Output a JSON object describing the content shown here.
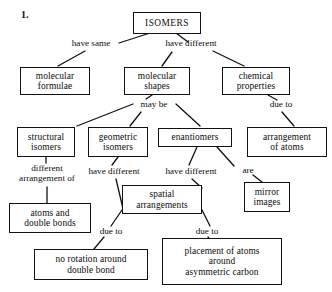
{
  "diagram": {
    "item_number": "1.",
    "title_node": "ISOMERS",
    "nodes": [
      {
        "id": "isomers",
        "label": "ISOMERS"
      },
      {
        "id": "molecular-formulae",
        "label": "molecular\nformulae"
      },
      {
        "id": "molecular-shapes",
        "label": "molecular\nshapes"
      },
      {
        "id": "chemical-properties",
        "label": "chemical\nproperties"
      },
      {
        "id": "structural-isomers",
        "label": "structural\nisomers"
      },
      {
        "id": "geometric-isomers",
        "label": "geometric\nisomers"
      },
      {
        "id": "enantiomers",
        "label": "enantiomers"
      },
      {
        "id": "arrangement-of-atoms",
        "label": "arrangement\nof atoms"
      },
      {
        "id": "atoms-and-double-bonds",
        "label": "atoms and\ndouble bonds"
      },
      {
        "id": "spatial-arrangements",
        "label": "spatial\narrangements"
      },
      {
        "id": "mirror-images",
        "label": "mirror\nimages"
      },
      {
        "id": "no-rotation",
        "label": "no rotation around\ndouble bond"
      },
      {
        "id": "placement-of-atoms",
        "label": "placement of atoms\naround\nasymmetric carbon"
      }
    ],
    "link_labels": [
      {
        "id": "have-same",
        "label": "have same"
      },
      {
        "id": "have-different-top",
        "label": "have different"
      },
      {
        "id": "may-be",
        "label": "may  be"
      },
      {
        "id": "due-to-top-right",
        "label": "due to"
      },
      {
        "id": "different-arrangement-of",
        "label": "different\narrangement of"
      },
      {
        "id": "have-different-geometric",
        "label": "have different"
      },
      {
        "id": "have-different-enantiomers",
        "label": "have different"
      },
      {
        "id": "are",
        "label": "are"
      },
      {
        "id": "due-to-left",
        "label": "due to"
      },
      {
        "id": "due-to-right",
        "label": "due to"
      }
    ],
    "colors": {
      "border": "#111111",
      "text": "#0d0d0d",
      "background": "#ffffff"
    }
  }
}
